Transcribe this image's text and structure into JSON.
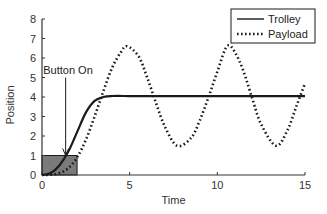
{
  "chart_data": {
    "type": "line",
    "title": "",
    "xlabel": "Time",
    "ylabel": "Position",
    "xlim": [
      0,
      15
    ],
    "ylim": [
      0,
      8
    ],
    "xticks": [
      0,
      5,
      10,
      15
    ],
    "yticks": [
      0,
      1,
      2,
      3,
      4,
      5,
      6,
      7,
      8
    ],
    "grid": false,
    "legend_position": "upper right",
    "series": [
      {
        "name": "Trolley",
        "style": "solid",
        "x": [
          0,
          0.5,
          1.0,
          1.5,
          2.0,
          2.5,
          3.0,
          3.5,
          4.0,
          5,
          6,
          8,
          10,
          12,
          14,
          15
        ],
        "y": [
          0,
          0.1,
          0.5,
          1.2,
          2.2,
          3.2,
          3.8,
          4.0,
          4.05,
          4.05,
          4.05,
          4.05,
          4.05,
          4.05,
          4.05,
          4.05
        ]
      },
      {
        "name": "Payload",
        "style": "dotted",
        "x": [
          0,
          0.5,
          1.0,
          1.5,
          2.0,
          2.5,
          3.0,
          3.5,
          4.0,
          4.5,
          4.85,
          5.5,
          6.0,
          6.5,
          7.0,
          7.7,
          8.5,
          9.0,
          9.5,
          10.0,
          10.55,
          11.0,
          11.5,
          12.0,
          12.5,
          13.35,
          14.0,
          14.5,
          15.0
        ],
        "y": [
          0,
          0.02,
          0.1,
          0.35,
          0.9,
          1.8,
          3.0,
          4.3,
          5.5,
          6.3,
          6.6,
          6.1,
          5.0,
          3.7,
          2.5,
          1.5,
          1.9,
          2.8,
          4.0,
          5.3,
          6.6,
          6.3,
          5.3,
          3.9,
          2.6,
          1.5,
          2.3,
          3.5,
          4.7
        ]
      }
    ],
    "annotations": [
      {
        "type": "text",
        "text": "Button On",
        "x": 0.3,
        "y": 5.4
      },
      {
        "type": "arrow",
        "from": [
          1.35,
          5.0
        ],
        "to": [
          1.35,
          1.0
        ]
      },
      {
        "type": "shaded_rect",
        "x0": 0,
        "x1": 2.0,
        "y0": 0,
        "y1": 1,
        "color": "#7a7a7a"
      }
    ],
    "legend": [
      "Trolley",
      "Payload"
    ]
  },
  "colors": {
    "line": "#1a1a1a",
    "axis": "#333333",
    "shade": "#7a7a7a",
    "background": "#ffffff"
  }
}
